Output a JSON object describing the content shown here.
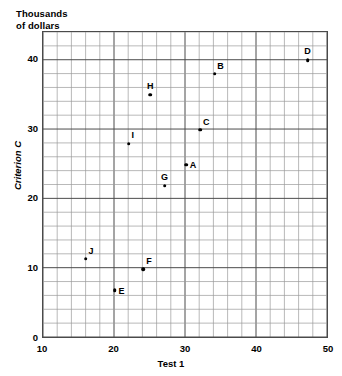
{
  "chart_data": {
    "type": "scatter",
    "title": "",
    "unit_caption": "Thousands\nof dollars",
    "xlabel": "Test 1",
    "ylabel": "Criterion C",
    "xlim": [
      10,
      50
    ],
    "ylim": [
      0,
      44
    ],
    "xticks": [
      10,
      20,
      30,
      40,
      50
    ],
    "yticks": [
      0,
      10,
      20,
      30,
      40
    ],
    "xtick_labels": [
      "10",
      "20",
      "30",
      "40",
      "50"
    ],
    "ytick_labels": [
      "0",
      "10",
      "20",
      "30",
      "40"
    ],
    "x_minor_step": 2,
    "y_minor_step": 2,
    "grid": true,
    "legend": "none",
    "point_color": "#000000",
    "grid_color": "#9a9a9a",
    "frame_color": "#4a4a4a",
    "points": [
      {
        "label": "A",
        "x": 30,
        "y": 25,
        "label_dx": 7,
        "label_dy": 0
      },
      {
        "label": "B",
        "x": 34,
        "y": 38,
        "label_dx": 6,
        "label_dy": -8
      },
      {
        "label": "C",
        "x": 32,
        "y": 30,
        "label_dx": 6,
        "label_dy": -8
      },
      {
        "label": "D",
        "x": 47,
        "y": 40,
        "label_dx": 0,
        "label_dy": -9
      },
      {
        "label": "E",
        "x": 20,
        "y": 7,
        "label_dx": 7,
        "label_dy": 1
      },
      {
        "label": "F",
        "x": 24,
        "y": 10,
        "label_dx": 6,
        "label_dy": -8
      },
      {
        "label": "G",
        "x": 27,
        "y": 22,
        "label_dx": 0,
        "label_dy": -9
      },
      {
        "label": "H",
        "x": 25,
        "y": 35,
        "label_dx": 0,
        "label_dy": -9
      },
      {
        "label": "I",
        "x": 22,
        "y": 28,
        "label_dx": 4,
        "label_dy": -9
      },
      {
        "label": "J",
        "x": 16,
        "y": 11.5,
        "label_dx": 5,
        "label_dy": -8
      }
    ]
  }
}
